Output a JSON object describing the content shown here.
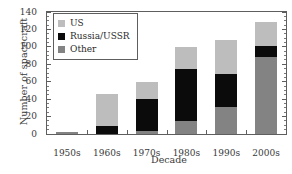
{
  "chart_data": {
    "type": "bar",
    "stacked": true,
    "title": "",
    "xlabel": "Decade",
    "ylabel": "Number of spacecraft",
    "categories": [
      "1950s",
      "1960s",
      "1970s",
      "1980s",
      "1990s",
      "2000s"
    ],
    "series": [
      {
        "name": "Other",
        "color": "#838383",
        "values": [
          2,
          0,
          4,
          15,
          31,
          88
        ]
      },
      {
        "name": "Russia/USSR",
        "color": "#0b0b0b",
        "values": [
          0,
          9,
          36,
          60,
          38,
          13
        ]
      },
      {
        "name": "US",
        "color": "#bdbdbd",
        "values": [
          0,
          37,
          20,
          25,
          39,
          27
        ]
      }
    ],
    "stack_order": [
      "Other",
      "Russia/USSR",
      "US"
    ],
    "totals": [
      2,
      46,
      60,
      100,
      108,
      128
    ],
    "ylim": [
      0,
      140
    ],
    "ytick_labels": [
      "0",
      "20",
      "40",
      "60",
      "80",
      "100",
      "120",
      "140"
    ],
    "ytick_values": [
      0,
      20,
      40,
      60,
      80,
      100,
      120,
      140
    ],
    "yminor_step": 5,
    "grid": false,
    "legend_position": "upper-left",
    "legend_entries": [
      "US",
      "Russia/USSR",
      "Other"
    ],
    "frame": true
  }
}
